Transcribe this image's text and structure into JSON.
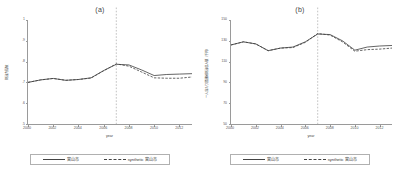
{
  "figure": {
    "panels": [
      {
        "id": "a",
        "title": "(a)",
        "ylabel": "財政力指数",
        "xlabel": "year",
        "yticks": [
          "1",
          ".9",
          ".8",
          ".7",
          ".6",
          ".5"
        ],
        "ylim": [
          0.5,
          1.0
        ],
        "xticks": [
          "2000",
          "2002",
          "2004",
          "2006",
          "2008",
          "2010",
          "2012"
        ],
        "xlim": [
          2000,
          2013
        ],
        "treatment_year": 2007,
        "legend": {
          "treated_label": "富山市",
          "synthetic_label": "synthetic 富山市"
        }
      },
      {
        "id": "b",
        "title": "(b)",
        "ylabel": "一人当たり普通税財政収入額（千円）",
        "xlabel": "year",
        "yticks": [
          "150",
          "130",
          "110",
          "90",
          "70",
          "50"
        ],
        "ylim": [
          50,
          150
        ],
        "xticks": [
          "2000",
          "2002",
          "2004",
          "2006",
          "2008",
          "2010",
          "2012"
        ],
        "xlim": [
          2000,
          2013
        ],
        "treatment_year": 2007,
        "legend": {
          "treated_label": "富山市",
          "synthetic_label": "synthetic 富山市"
        }
      }
    ]
  },
  "chart_data": [
    {
      "type": "line",
      "panel": "a",
      "title": "(a)",
      "xlabel": "year",
      "ylabel": "財政力指数",
      "xlim": [
        2000,
        2013
      ],
      "ylim": [
        0.5,
        1.0
      ],
      "grid": false,
      "legend_position": "bottom",
      "annotations": [
        {
          "type": "vline",
          "x": 2007,
          "style": "dotted",
          "label": "treatment year"
        }
      ],
      "x": [
        2000,
        2001,
        2002,
        2003,
        2004,
        2005,
        2006,
        2007,
        2008,
        2009,
        2010,
        2011,
        2012,
        2013
      ],
      "series": [
        {
          "name": "富山市",
          "style": "solid",
          "values": [
            0.7,
            0.712,
            0.719,
            0.71,
            0.714,
            0.722,
            0.757,
            0.787,
            0.784,
            0.76,
            0.733,
            0.738,
            0.74,
            0.742
          ]
        },
        {
          "name": "synthetic 富山市",
          "style": "dashed",
          "values": [
            0.7,
            0.712,
            0.719,
            0.71,
            0.714,
            0.721,
            0.756,
            0.789,
            0.778,
            0.75,
            0.722,
            0.72,
            0.72,
            0.726
          ]
        }
      ]
    },
    {
      "type": "line",
      "panel": "b",
      "title": "(b)",
      "xlabel": "year",
      "ylabel": "一人当たり普通税財政収入額（千円）",
      "xlim": [
        2000,
        2013
      ],
      "ylim": [
        50,
        150
      ],
      "grid": false,
      "legend_position": "bottom",
      "annotations": [
        {
          "type": "vline",
          "x": 2007,
          "style": "dotted",
          "label": "treatment year"
        }
      ],
      "x": [
        2000,
        2001,
        2002,
        2003,
        2004,
        2005,
        2006,
        2007,
        2008,
        2009,
        2010,
        2011,
        2012,
        2013
      ],
      "series": [
        {
          "name": "富山市",
          "style": "solid",
          "values": [
            126.0,
            129.0,
            127.0,
            120.5,
            123.0,
            124.0,
            129.0,
            136.5,
            136.0,
            130.0,
            121.0,
            124.0,
            125.0,
            125.5
          ]
        },
        {
          "name": "synthetic 富山市",
          "style": "dashed",
          "values": [
            126.0,
            129.0,
            127.0,
            120.5,
            123.0,
            123.5,
            128.5,
            137.0,
            135.5,
            129.0,
            120.0,
            121.5,
            122.0,
            123.0
          ]
        }
      ]
    }
  ]
}
